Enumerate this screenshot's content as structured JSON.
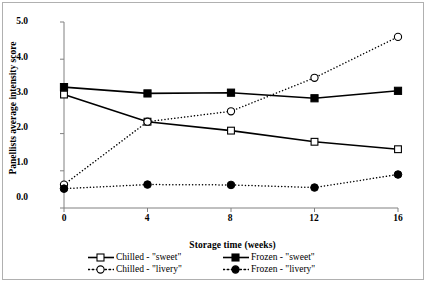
{
  "chart_data": {
    "type": "line",
    "title": "",
    "xlabel": "Storage time (weeks)",
    "ylabel": "Panellists average intensity score",
    "x": [
      0,
      4,
      8,
      12,
      16
    ],
    "xticks": [
      "0",
      "4",
      "8",
      "12",
      "16"
    ],
    "yticks": [
      "0.0",
      "1.0",
      "2.0",
      "3.0",
      "4.0",
      "5.0"
    ],
    "xlim": [
      0,
      16
    ],
    "ylim": [
      0,
      5
    ],
    "grid": false,
    "legend_position": "bottom",
    "series": [
      {
        "name": "Chilled - \"sweet\"",
        "marker": "open-square",
        "line": "solid",
        "color": "#000000",
        "values": [
          3.05,
          2.32,
          2.08,
          1.78,
          1.58
        ]
      },
      {
        "name": "Chilled - \"livery\"",
        "marker": "open-circle",
        "line": "dotted",
        "color": "#000000",
        "values": [
          0.63,
          2.32,
          2.6,
          3.5,
          4.6
        ]
      },
      {
        "name": "Frozen - \"sweet\"",
        "marker": "filled-square",
        "line": "solid",
        "color": "#000000",
        "values": [
          3.25,
          3.08,
          3.1,
          2.95,
          3.15
        ]
      },
      {
        "name": "Frozen - \"livery\"",
        "marker": "filled-circle",
        "line": "dotted",
        "color": "#000000",
        "values": [
          0.52,
          0.63,
          0.62,
          0.55,
          0.9
        ]
      }
    ]
  },
  "axis": {
    "y_title": "Panellists average intensity score",
    "x_title": "Storage time (weeks)"
  },
  "legend": {
    "items": [
      {
        "label": "Chilled - \"sweet\""
      },
      {
        "label": "Frozen - \"sweet\""
      },
      {
        "label": "Chilled - \"livery\""
      },
      {
        "label": "Frozen - \"livery\""
      }
    ]
  },
  "colors": {
    "axis": "#808080",
    "series": "#000000",
    "background": "#ffffff",
    "border": "#b0b0b0"
  }
}
